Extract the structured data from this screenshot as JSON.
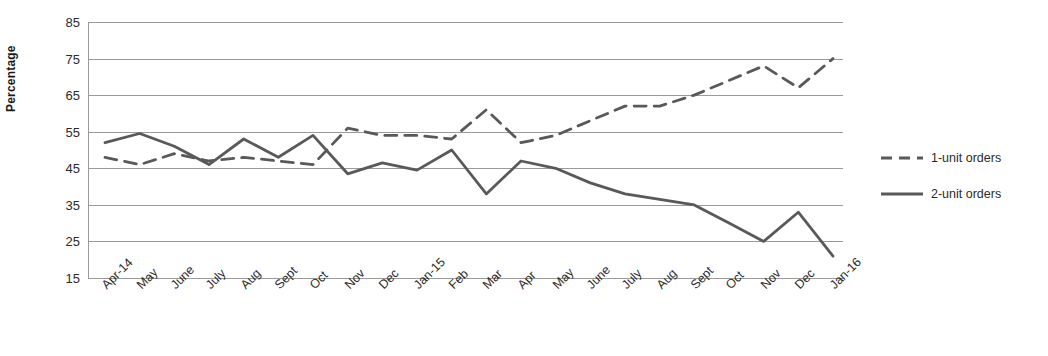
{
  "chart_data": {
    "type": "line",
    "title": "",
    "xlabel": "",
    "ylabel": "Percentage",
    "ylim": [
      15,
      85
    ],
    "ytick_step": 10,
    "yticks": [
      85,
      75,
      65,
      55,
      45,
      35,
      25,
      15
    ],
    "grid": true,
    "legend_position": "right",
    "categories": [
      "Apr-14",
      "May",
      "June",
      "July",
      "Aug",
      "Sept",
      "Oct",
      "Nov",
      "Dec",
      "Jan-15",
      "Feb",
      "Mar",
      "Apr",
      "May",
      "June",
      "July",
      "Aug",
      "Sept",
      "Oct",
      "Nov",
      "Dec",
      "Jan-16"
    ],
    "series": [
      {
        "name": "1-unit orders",
        "style": "dashed",
        "color": "#595959",
        "values": [
          48,
          46,
          49,
          47,
          48,
          47,
          46,
          56,
          54,
          54,
          53,
          61,
          52,
          54,
          58,
          62,
          62,
          65,
          69,
          73,
          67,
          75
        ]
      },
      {
        "name": "2-unit orders",
        "style": "solid",
        "color": "#595959",
        "values": [
          52,
          54.5,
          51,
          46,
          53,
          48,
          54,
          43.5,
          46.5,
          44.5,
          50,
          38,
          47,
          45,
          41,
          38,
          36.5,
          35,
          30,
          25,
          33,
          21
        ]
      }
    ]
  },
  "legend": {
    "items": [
      {
        "label": "1-unit orders",
        "swatch": "dashed-line-swatch"
      },
      {
        "label": "2-unit orders",
        "swatch": "solid-line-swatch"
      }
    ]
  },
  "colors": {
    "series_line": "#595959",
    "gridline": "#9a9a9a",
    "text": "#2b2b2b",
    "background": "#ffffff"
  }
}
